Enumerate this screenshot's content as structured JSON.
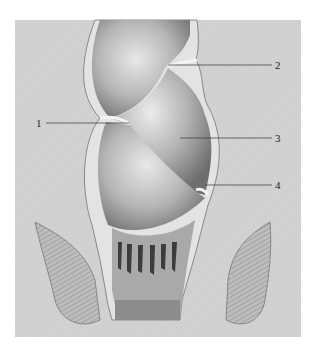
{
  "figure": {
    "colors": {
      "background": "#cfcfcf",
      "page": "#ffffff",
      "mucosa": "#b8b8b8",
      "wall": "#e6e6e6",
      "shadow": "#5a5a5a",
      "leader": "#333333"
    },
    "labels": [
      {
        "id": "1",
        "text": "1",
        "x": 38,
        "y": 118,
        "line_to_x": 130
      },
      {
        "id": "2",
        "text": "2",
        "x": 275,
        "y": 60,
        "line_from_x": 168
      },
      {
        "id": "3",
        "text": "3",
        "x": 275,
        "y": 133,
        "line_from_x": 180
      },
      {
        "id": "4",
        "text": "4",
        "x": 275,
        "y": 180,
        "line_from_x": 205
      }
    ]
  }
}
